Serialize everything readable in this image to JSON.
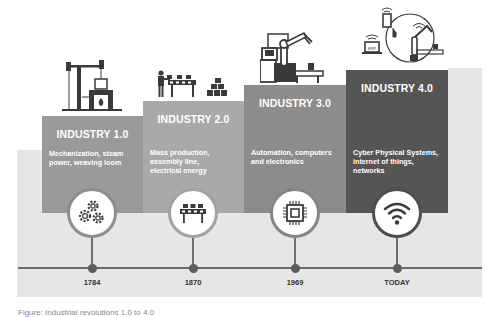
{
  "colors": {
    "stage1": "#9a9a9a",
    "stage2": "#a9a9a9",
    "stage3": "#8c8c8c",
    "stage4": "#555555",
    "background_panel": "#e6e6e6",
    "timeline": "#6a6a6a",
    "icon": "#3a3a3a"
  },
  "stages": [
    {
      "title": "INDUSTRY 1.0",
      "description": [
        "Mechanization, steam",
        "power, weaving loom"
      ],
      "year": "1784",
      "top_icon": "steam-engine-icon",
      "circle_icon": "gears-icon"
    },
    {
      "title": "INDUSTRY 2.0",
      "description": [
        "Mass production,",
        "assembly line,",
        "electrical energy"
      ],
      "year": "1870",
      "top_icon": "assembly-line-worker-icon",
      "circle_icon": "conveyor-belt-icon"
    },
    {
      "title": "INDUSTRY 3.0",
      "description": [
        "Automation, computers",
        "and electronics"
      ],
      "year": "1969",
      "top_icon": "robot-arm-computer-icon",
      "circle_icon": "microchip-icon"
    },
    {
      "title": "INDUSTRY 4.0",
      "description": [
        "Cyber Physical Systems,",
        "internet of things,",
        "networks"
      ],
      "year": "TODAY",
      "top_icon": "connected-iot-network-icon",
      "circle_icon": "wifi-icon",
      "erp_label": "ERP"
    }
  ],
  "caption": "Figure: Industrial revolutions 1.0 to 4.0"
}
